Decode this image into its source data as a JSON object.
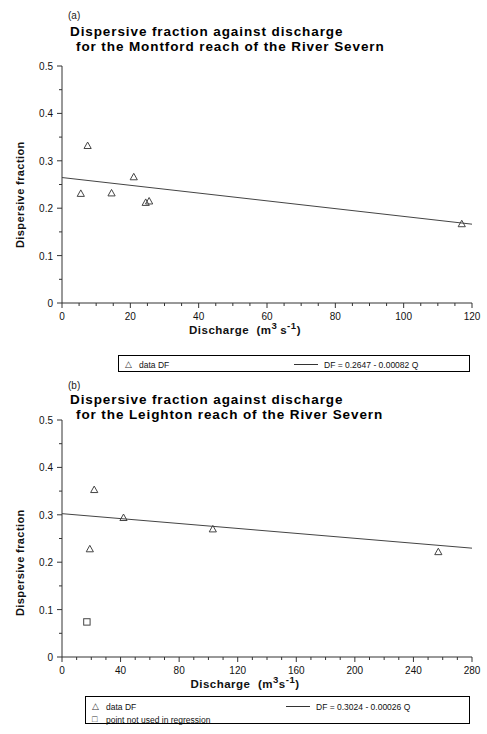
{
  "figure": {
    "panels": [
      {
        "panel_label": "(a)",
        "title_line1": "Dispersive fraction against discharge",
        "title_line2": "for the Montford reach of the River Severn",
        "legend": {
          "data_marker": "triangle",
          "data_label": "data DF",
          "fit_label": "DF = 0.2647 - 0.00082 Q"
        }
      },
      {
        "panel_label": "(b)",
        "title_line1": "Dispersive fraction against discharge",
        "title_line2": "for the Leighton reach of the River Severn",
        "legend": {
          "data_marker": "triangle",
          "data_label": "data DF",
          "excluded_marker": "square",
          "excluded_label": "point not used in regression",
          "fit_label": "DF = 0.3024 - 0.00026 Q"
        }
      }
    ]
  },
  "chart_data": [
    {
      "type": "scatter",
      "title": "Dispersive fraction against discharge for the Montford reach of the River Severn",
      "panel": "(a)",
      "xlabel": "Discharge (m³ s⁻¹)",
      "ylabel": "Dispersive fraction",
      "xlim": [
        0,
        120
      ],
      "ylim": [
        0,
        0.5
      ],
      "xticks": [
        0,
        20,
        40,
        60,
        80,
        100,
        120
      ],
      "xtick_labels": [
        "0",
        "20",
        "40",
        "60",
        "80",
        "100",
        "120"
      ],
      "yticks": [
        0,
        0.1,
        0.2,
        0.3,
        0.4,
        0.5
      ],
      "ytick_labels": [
        "0",
        "0.1",
        "0.2",
        "0.3",
        "0.4",
        "0.5"
      ],
      "x_minor_step": 5,
      "y_minor_step": 0.05,
      "grid": false,
      "legend_position": "below",
      "series": [
        {
          "name": "data DF",
          "marker": "triangle",
          "points": [
            {
              "x": 5.5,
              "y": 0.231
            },
            {
              "x": 7.5,
              "y": 0.332
            },
            {
              "x": 14.5,
              "y": 0.232
            },
            {
              "x": 21.0,
              "y": 0.266
            },
            {
              "x": 24.5,
              "y": 0.212
            },
            {
              "x": 25.5,
              "y": 0.215
            },
            {
              "x": 117.0,
              "y": 0.167
            }
          ]
        },
        {
          "name": "DF = 0.2647 - 0.00082 Q",
          "type": "line",
          "intercept": 0.2647,
          "slope": -0.00082,
          "x_range": [
            0,
            120
          ]
        }
      ]
    },
    {
      "type": "scatter",
      "title": "Dispersive fraction against discharge for the Leighton reach of the River Severn",
      "panel": "(b)",
      "xlabel": "Discharge (m³ s⁻¹)",
      "ylabel": "Dispersive fraction",
      "xlim": [
        0,
        280
      ],
      "ylim": [
        0,
        0.5
      ],
      "xticks": [
        0,
        40,
        80,
        120,
        160,
        200,
        240,
        280
      ],
      "xtick_labels": [
        "0",
        "40",
        "80",
        "120",
        "160",
        "200",
        "240",
        "280"
      ],
      "yticks": [
        0,
        0.1,
        0.2,
        0.3,
        0.4,
        0.5
      ],
      "ytick_labels": [
        "0",
        "0.1",
        "0.2",
        "0.3",
        "0.4",
        "0.5"
      ],
      "x_minor_step": 10,
      "y_minor_step": 0.05,
      "grid": false,
      "legend_position": "below",
      "series": [
        {
          "name": "data DF",
          "marker": "triangle",
          "points": [
            {
              "x": 19.0,
              "y": 0.228
            },
            {
              "x": 22.0,
              "y": 0.353
            },
            {
              "x": 42.0,
              "y": 0.294
            },
            {
              "x": 103.0,
              "y": 0.27
            },
            {
              "x": 257.0,
              "y": 0.222
            }
          ]
        },
        {
          "name": "point not used in regression",
          "marker": "square",
          "points": [
            {
              "x": 17.0,
              "y": 0.074
            }
          ]
        },
        {
          "name": "DF = 0.3024 - 0.00026 Q",
          "type": "line",
          "intercept": 0.3024,
          "slope": -0.00026,
          "x_range": [
            0,
            280
          ]
        }
      ]
    }
  ]
}
